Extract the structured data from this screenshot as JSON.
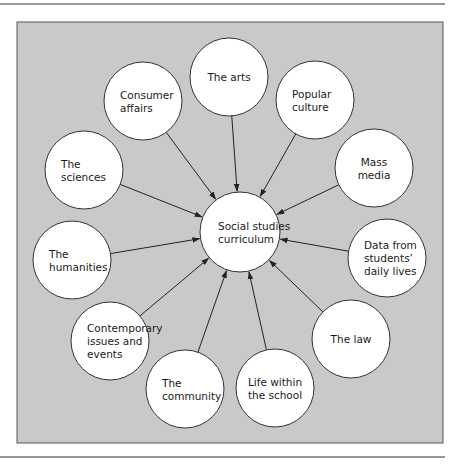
{
  "colors": {
    "panel_fill": "#c9c9c9",
    "panel_stroke": "#555555",
    "circle_fill": "#ffffff",
    "circle_stroke": "#333333",
    "arrow": "#222222",
    "rule": "#333333"
  },
  "center": {
    "id": "social-studies-curriculum",
    "lines": [
      "Social studies",
      "curriculum"
    ],
    "cx": 240,
    "cy": 232,
    "r": 40
  },
  "nodes": [
    {
      "id": "the-arts",
      "lines": [
        "The arts"
      ],
      "cx": 229,
      "cy": 77,
      "align": "middle"
    },
    {
      "id": "consumer-affairs",
      "lines": [
        "Consumer",
        "affairs"
      ],
      "cx": 143,
      "cy": 101,
      "align": "start"
    },
    {
      "id": "popular-culture",
      "lines": [
        "Popular",
        "culture"
      ],
      "cx": 315,
      "cy": 100,
      "align": "start"
    },
    {
      "id": "the-sciences",
      "lines": [
        "The",
        "sciences"
      ],
      "cx": 84,
      "cy": 170,
      "align": "start"
    },
    {
      "id": "mass-media",
      "lines": [
        "Mass",
        "media"
      ],
      "cx": 374,
      "cy": 168,
      "align": "middle"
    },
    {
      "id": "the-humanities",
      "lines": [
        "The",
        "humanities"
      ],
      "cx": 72,
      "cy": 260,
      "align": "start"
    },
    {
      "id": "data-from-students-daily-lives",
      "lines": [
        "Data from",
        "students’",
        "daily lives"
      ],
      "cx": 387,
      "cy": 258,
      "align": "start"
    },
    {
      "id": "contemporary-issues-and-events",
      "lines": [
        "Contemporary",
        "issues and",
        "events"
      ],
      "cx": 110,
      "cy": 341,
      "align": "start"
    },
    {
      "id": "the-law",
      "lines": [
        "The law"
      ],
      "cx": 351,
      "cy": 339,
      "align": "middle"
    },
    {
      "id": "the-community",
      "lines": [
        "The",
        "community"
      ],
      "cx": 185,
      "cy": 389,
      "align": "start"
    },
    {
      "id": "life-within-the-school",
      "lines": [
        "Life within",
        "the school"
      ],
      "cx": 275,
      "cy": 388,
      "align": "middle"
    }
  ],
  "node_radius": 39
}
